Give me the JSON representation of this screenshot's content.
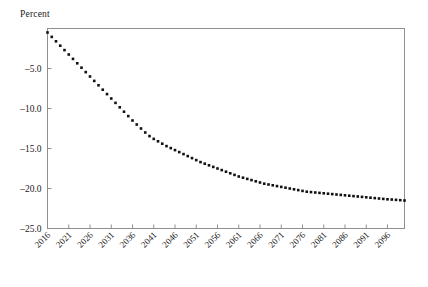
{
  "chart_data": {
    "type": "line",
    "title": "",
    "ylabel": "Percent",
    "xlabel": "",
    "ylim": [
      -25.0,
      0.0
    ],
    "xlim": [
      2016,
      2100
    ],
    "grid": false,
    "legend": null,
    "marker": "square",
    "marker_color": "#111111",
    "frame_color": "#8f8f8f",
    "ytick_labels": [
      "-5.0",
      "-10.0",
      "-15.0",
      "-20.0",
      "-25.0"
    ],
    "ytick_values": [
      -5.0,
      -10.0,
      -15.0,
      -20.0,
      -25.0
    ],
    "xtick_labels": [
      "2016",
      "2021",
      "2026",
      "2031",
      "2036",
      "2041",
      "2046",
      "2051",
      "2056",
      "2061",
      "2066",
      "2071",
      "2076",
      "2081",
      "2086",
      "2091",
      "2096"
    ],
    "xtick_values": [
      2016,
      2021,
      2026,
      2031,
      2036,
      2041,
      2046,
      2051,
      2056,
      2061,
      2066,
      2071,
      2076,
      2081,
      2086,
      2091,
      2096
    ],
    "xtick_rotation": 45,
    "x": [
      2016,
      2017,
      2018,
      2019,
      2020,
      2021,
      2022,
      2023,
      2024,
      2025,
      2026,
      2027,
      2028,
      2029,
      2030,
      2031,
      2032,
      2033,
      2034,
      2035,
      2036,
      2037,
      2038,
      2039,
      2040,
      2041,
      2042,
      2043,
      2044,
      2045,
      2046,
      2047,
      2048,
      2049,
      2050,
      2051,
      2052,
      2053,
      2054,
      2055,
      2056,
      2057,
      2058,
      2059,
      2060,
      2061,
      2062,
      2063,
      2064,
      2065,
      2066,
      2067,
      2068,
      2069,
      2070,
      2071,
      2072,
      2073,
      2074,
      2075,
      2076,
      2077,
      2078,
      2079,
      2080,
      2081,
      2082,
      2083,
      2084,
      2085,
      2086,
      2087,
      2088,
      2089,
      2090,
      2091,
      2092,
      2093,
      2094,
      2095,
      2096,
      2097,
      2098,
      2099,
      2100
    ],
    "values": [
      -0.5,
      -1.05,
      -1.6,
      -2.15,
      -2.7,
      -3.25,
      -3.8,
      -4.35,
      -4.9,
      -5.45,
      -6.0,
      -6.55,
      -7.1,
      -7.65,
      -8.2,
      -8.75,
      -9.3,
      -9.85,
      -10.4,
      -10.95,
      -11.5,
      -12.0,
      -12.5,
      -13.0,
      -13.45,
      -13.8,
      -14.1,
      -14.4,
      -14.7,
      -14.95,
      -15.2,
      -15.45,
      -15.7,
      -15.95,
      -16.2,
      -16.45,
      -16.7,
      -16.9,
      -17.1,
      -17.3,
      -17.5,
      -17.7,
      -17.9,
      -18.1,
      -18.3,
      -18.5,
      -18.65,
      -18.8,
      -18.95,
      -19.1,
      -19.25,
      -19.4,
      -19.5,
      -19.6,
      -19.7,
      -19.8,
      -19.9,
      -20.0,
      -20.1,
      -20.2,
      -20.3,
      -20.4,
      -20.45,
      -20.5,
      -20.55,
      -20.6,
      -20.65,
      -20.7,
      -20.75,
      -20.8,
      -20.85,
      -20.9,
      -20.95,
      -21.0,
      -21.05,
      -21.1,
      -21.15,
      -21.2,
      -21.25,
      -21.3,
      -21.35,
      -21.38,
      -21.42,
      -21.46,
      -21.5
    ]
  }
}
